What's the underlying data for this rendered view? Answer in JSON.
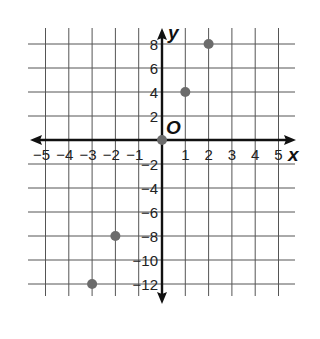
{
  "chart_data": {
    "type": "scatter",
    "title": "",
    "xlabel": "x",
    "ylabel": "y",
    "origin_label": "O",
    "xlim": [
      -5,
      5
    ],
    "ylim": [
      -12,
      8
    ],
    "grid": true,
    "x_ticks": [
      -5,
      -4,
      -3,
      -2,
      -1,
      1,
      2,
      3,
      4,
      5
    ],
    "y_ticks": [
      8,
      6,
      4,
      2,
      -2,
      -4,
      -6,
      -8,
      -10,
      -12
    ],
    "x_tick_labels": [
      "−5",
      "−4",
      "−3",
      "−2",
      "−1",
      "1",
      "2",
      "3",
      "4",
      "5"
    ],
    "y_tick_labels": [
      "8",
      "6",
      "4",
      "2",
      "−2",
      "−4",
      "−6",
      "−8",
      "−10",
      "−12"
    ],
    "series": [
      {
        "name": "points",
        "points": [
          {
            "x": -3,
            "y": -12
          },
          {
            "x": -2,
            "y": -8
          },
          {
            "x": 0,
            "y": 0
          },
          {
            "x": 1,
            "y": 4
          },
          {
            "x": 2,
            "y": 8
          }
        ]
      }
    ],
    "colors": {
      "grid": "#555555",
      "axis": "#111111",
      "point": "#6b6b6b"
    }
  }
}
